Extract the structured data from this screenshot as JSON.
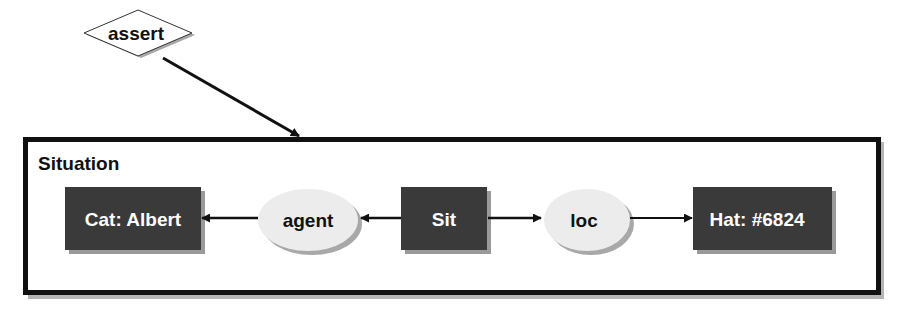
{
  "diagram": {
    "type": "conceptual-graph",
    "assert_node": {
      "label": "assert",
      "shape": "diamond"
    },
    "context": {
      "label": "Situation"
    },
    "concepts": [
      {
        "id": "cat",
        "label": "Cat: Albert"
      },
      {
        "id": "sit",
        "label": "Sit"
      },
      {
        "id": "hat",
        "label": "Hat: #6824"
      }
    ],
    "relations": [
      {
        "id": "agent",
        "label": "agent"
      },
      {
        "id": "loc",
        "label": "loc"
      }
    ],
    "edges": [
      {
        "from": "assert",
        "to": "Situation"
      },
      {
        "from": "sit",
        "to": "agent"
      },
      {
        "from": "agent",
        "to": "cat"
      },
      {
        "from": "sit",
        "to": "loc"
      },
      {
        "from": "loc",
        "to": "hat"
      }
    ],
    "colors": {
      "concept_fill": "#3a3a3a",
      "concept_text": "#ffffff",
      "relation_fill": "#ececec",
      "relation_text": "#111111",
      "stroke": "#111111",
      "shadow": "#9a9a9a"
    }
  }
}
